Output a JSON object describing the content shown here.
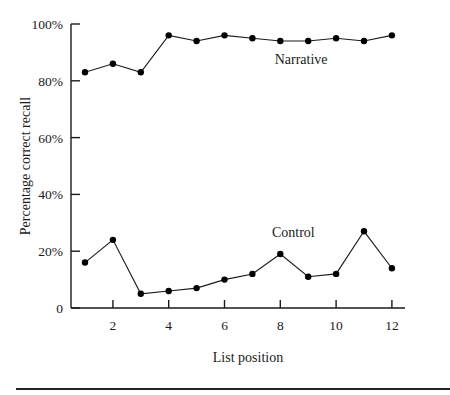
{
  "chart_data": {
    "type": "line",
    "title": "",
    "xlabel": "List position",
    "ylabel": "Percentage correct recall",
    "x": [
      1,
      2,
      3,
      4,
      5,
      6,
      7,
      8,
      9,
      10,
      11,
      12
    ],
    "x_ticks": [
      2,
      4,
      6,
      8,
      10,
      12
    ],
    "x_tick_labels": [
      "2",
      "4",
      "6",
      "8",
      "10",
      "12"
    ],
    "y_ticks": [
      0,
      20,
      40,
      60,
      80,
      100
    ],
    "y_tick_labels": [
      "0",
      "20%",
      "40%",
      "60%",
      "80%",
      "100%"
    ],
    "xlim": [
      0.5,
      12.5
    ],
    "ylim": [
      0,
      100
    ],
    "grid": false,
    "legend": "inline labels",
    "series": [
      {
        "name": "Narrative",
        "values": [
          83,
          86,
          83,
          96,
          94,
          96,
          95,
          94,
          94,
          95,
          94,
          96
        ],
        "label_position": {
          "x": 7.8,
          "y": 86
        }
      },
      {
        "name": "Control",
        "values": [
          16,
          24,
          5,
          6,
          7,
          10,
          12,
          19,
          11,
          12,
          27,
          14
        ],
        "label_position": {
          "x": 7.7,
          "y": 25
        }
      }
    ],
    "colors": {
      "line": "#1a1a1a",
      "marker": "#000000"
    }
  }
}
